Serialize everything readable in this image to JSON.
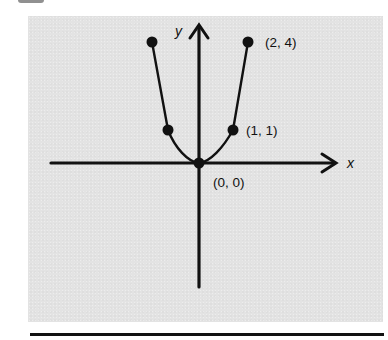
{
  "figure": {
    "type": "function-graph",
    "function": "y = x^2",
    "axes": {
      "x_label": "x",
      "y_label": "y"
    },
    "points": [
      {
        "x": -2,
        "y": 4,
        "label": ""
      },
      {
        "x": -1,
        "y": 1,
        "label": ""
      },
      {
        "x": 0,
        "y": 0,
        "label": "(0, 0)"
      },
      {
        "x": 1,
        "y": 1,
        "label": "(1, 1)"
      },
      {
        "x": 2,
        "y": 4,
        "label": "(2, 4)"
      }
    ],
    "labels": {
      "origin": "(0, 0)",
      "p_1_1": "(1, 1)",
      "p_2_4": "(2, 4)"
    },
    "colors": {
      "panel_background": "#e3e3e3",
      "ink": "#111111"
    }
  }
}
